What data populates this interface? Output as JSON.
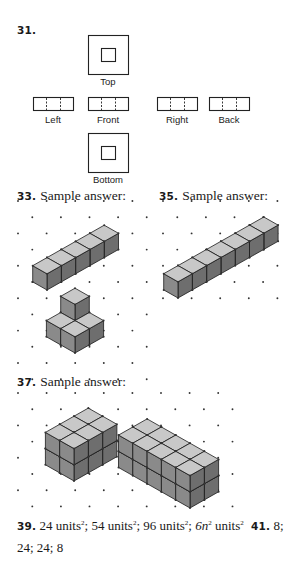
{
  "exercise_31": {
    "number": "31.",
    "views": {
      "top": "Top",
      "left": "Left",
      "front": "Front",
      "right": "Right",
      "back": "Back",
      "bottom": "Bottom"
    }
  },
  "exercise_33": {
    "number": "33.",
    "label": "Sample answer:",
    "figures": [
      {
        "description": "row of 5 cubes"
      },
      {
        "description": "L-shaped arrangement: 3 cubes on base with 1 cube stacked"
      }
    ]
  },
  "exercise_35": {
    "number": "35.",
    "label": "Sample answer:",
    "figures": [
      {
        "description": "row of 7 cubes"
      }
    ]
  },
  "exercise_37": {
    "number": "37.",
    "label": "Sample answer:",
    "figures": [
      {
        "description": "2 x 3 x 2 rectangular prism of cubes"
      },
      {
        "description": "2 x 5 x 2 rectangular prism of cubes"
      }
    ]
  },
  "exercise_39": {
    "number": "39.",
    "answers": [
      {
        "value": "24 units",
        "exp": "2"
      },
      {
        "value": "54 units",
        "exp": "2"
      },
      {
        "value": "96 units",
        "exp": "2"
      },
      {
        "value": "6n",
        "exp": "2",
        "suffix": " units",
        "suffix_exp": "2"
      }
    ]
  },
  "exercise_41": {
    "number": "41.",
    "line1": "8;",
    "line2": "24; 24; 8"
  },
  "colors": {
    "cube_top": "#c8c8c8",
    "cube_left": "#8a8a8a",
    "cube_right": "#6e6e6e",
    "dot": "#333333",
    "line": "#1a1a1a"
  }
}
